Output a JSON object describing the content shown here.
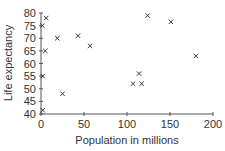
{
  "chart_data": {
    "type": "scatter",
    "title": "",
    "xlabel": "Population in millions",
    "ylabel": "Life expectancy",
    "xlim": [
      0,
      200
    ],
    "ylim": [
      40,
      80
    ],
    "xticks": [
      0,
      50,
      100,
      150,
      200
    ],
    "yticks": [
      40,
      45,
      50,
      55,
      60,
      65,
      70,
      75,
      80
    ],
    "grid": false,
    "legend": null,
    "marker": "x",
    "points": [
      {
        "x": 6,
        "y": 78
      },
      {
        "x": 1.5,
        "y": 75
      },
      {
        "x": 19,
        "y": 70
      },
      {
        "x": 43,
        "y": 71
      },
      {
        "x": 57,
        "y": 67
      },
      {
        "x": 5,
        "y": 65
      },
      {
        "x": 2,
        "y": 55
      },
      {
        "x": 25,
        "y": 48
      },
      {
        "x": 2,
        "y": 41.5
      },
      {
        "x": 124,
        "y": 79
      },
      {
        "x": 151,
        "y": 76.5
      },
      {
        "x": 180,
        "y": 63
      },
      {
        "x": 114,
        "y": 56
      },
      {
        "x": 107,
        "y": 52
      },
      {
        "x": 117,
        "y": 52
      }
    ]
  },
  "axes": {
    "xlabel": "Population in millions",
    "ylabel": "Life expectancy"
  }
}
